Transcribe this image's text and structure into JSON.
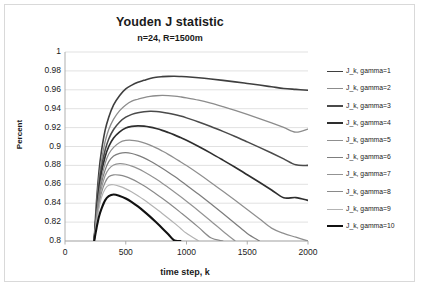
{
  "chart_data": {
    "type": "line",
    "title": "Youden J statistic",
    "subtitle": "n=24, R=1500m",
    "xlabel": "time step, k",
    "ylabel": "Percent",
    "xlim": [
      0,
      2000
    ],
    "ylim": [
      0.8,
      1.0
    ],
    "xticks": [
      "0",
      "500",
      "1000",
      "1500",
      "2000"
    ],
    "yticks": [
      "1",
      "0.98",
      "0.96",
      "0.94",
      "0.92",
      "0.9",
      "0.88",
      "0.86",
      "0.84",
      "0.82",
      "0.8"
    ],
    "grid": "horizontal",
    "legend_position": "right",
    "x": [
      240,
      260,
      280,
      300,
      330,
      360,
      400,
      450,
      500,
      550,
      600,
      650,
      700,
      750,
      800,
      850,
      900,
      950,
      1000,
      1100,
      1200,
      1300,
      1400,
      1500,
      1600,
      1700,
      1800,
      1900,
      2000
    ],
    "series": [
      {
        "name": "J_k, gamma=1",
        "color": "#3f3f3f",
        "width": 1.6,
        "values": [
          0.8,
          0.843,
          0.874,
          0.895,
          0.917,
          0.931,
          0.944,
          0.954,
          0.961,
          0.965,
          0.968,
          0.97,
          0.972,
          0.9733,
          0.9739,
          0.9742,
          0.9743,
          0.9741,
          0.9738,
          0.9728,
          0.9715,
          0.97,
          0.9684,
          0.9667,
          0.965,
          0.9632,
          0.9614,
          0.9604,
          0.9595
        ]
      },
      {
        "name": "J_k, gamma=2",
        "color": "#8c8c8c",
        "width": 1.3,
        "values": [
          0.8,
          0.838,
          0.866,
          0.885,
          0.905,
          0.918,
          0.929,
          0.938,
          0.944,
          0.948,
          0.95,
          0.9518,
          0.953,
          0.9537,
          0.954,
          0.9538,
          0.9533,
          0.9525,
          0.9515,
          0.949,
          0.9458,
          0.9421,
          0.9382,
          0.934,
          0.9296,
          0.925,
          0.9202,
          0.9152,
          0.9185
        ]
      },
      {
        "name": "J_k, gamma=3",
        "color": "#4a4a4a",
        "width": 1.55,
        "values": [
          0.8,
          0.834,
          0.86,
          0.878,
          0.896,
          0.908,
          0.918,
          0.926,
          0.931,
          0.934,
          0.9358,
          0.9368,
          0.9372,
          0.937,
          0.9363,
          0.9352,
          0.9338,
          0.9322,
          0.9303,
          0.926,
          0.9212,
          0.916,
          0.9106,
          0.9049,
          0.8991,
          0.8931,
          0.8869,
          0.8806,
          0.88
        ]
      },
      {
        "name": "J_k, gamma=4",
        "color": "#2e2e2e",
        "width": 1.7,
        "values": [
          0.8,
          0.831,
          0.855,
          0.872,
          0.889,
          0.9,
          0.909,
          0.9155,
          0.9196,
          0.9213,
          0.9218,
          0.9215,
          0.9205,
          0.919,
          0.9171,
          0.9148,
          0.9123,
          0.9095,
          0.9066,
          0.9,
          0.893,
          0.8856,
          0.878,
          0.8701,
          0.8621,
          0.854,
          0.8457,
          0.846,
          0.843
        ]
      },
      {
        "name": "J_k, gamma=5",
        "color": "#8f8f8f",
        "width": 1.25,
        "values": [
          0.8,
          0.828,
          0.85,
          0.866,
          0.882,
          0.892,
          0.899,
          0.9043,
          0.9064,
          0.9066,
          0.9056,
          0.9038,
          0.9014,
          0.8985,
          0.8952,
          0.8917,
          0.8879,
          0.8839,
          0.8798,
          0.8711,
          0.862,
          0.8526,
          0.843,
          0.8333,
          0.8235,
          0.8136,
          0.808,
          0.804,
          0.8
        ]
      },
      {
        "name": "J_k, gamma=6",
        "color": "#7d7d7d",
        "width": 1.25,
        "values": [
          0.8,
          0.826,
          0.846,
          0.861,
          0.875,
          0.884,
          0.89,
          0.8928,
          0.8935,
          0.8926,
          0.8906,
          0.8879,
          0.8847,
          0.881,
          0.877,
          0.8728,
          0.8684,
          0.8638,
          0.8591,
          0.8494,
          0.8393,
          0.829,
          0.8186,
          0.808,
          0.8,
          0.8,
          0.8,
          0.8,
          0.8
        ]
      },
      {
        "name": "J_k, gamma=7",
        "color": "#939393",
        "width": 1.2,
        "values": [
          0.8,
          0.824,
          0.842,
          0.856,
          0.869,
          0.876,
          0.8805,
          0.8818,
          0.8812,
          0.8793,
          0.8766,
          0.8733,
          0.8696,
          0.8655,
          0.8612,
          0.8566,
          0.8519,
          0.8471,
          0.8421,
          0.8318,
          0.8212,
          0.8104,
          0.8,
          0.8,
          0.8,
          0.8,
          0.8,
          0.8,
          0.8
        ]
      },
      {
        "name": "J_k, gamma=8",
        "color": "#8a8a8a",
        "width": 1.2,
        "values": [
          0.8,
          0.822,
          0.838,
          0.851,
          0.862,
          0.868,
          0.87,
          0.8697,
          0.8681,
          0.8655,
          0.8622,
          0.8584,
          0.8543,
          0.8498,
          0.8452,
          0.8404,
          0.8354,
          0.8303,
          0.8251,
          0.8144,
          0.8034,
          0.8,
          0.8,
          0.8,
          0.8,
          0.8,
          0.8,
          0.8,
          0.8
        ]
      },
      {
        "name": "J_k, gamma=9",
        "color": "#b3b3b3",
        "width": 1.2,
        "values": [
          0.8,
          0.82,
          0.835,
          0.846,
          0.855,
          0.859,
          0.8595,
          0.8578,
          0.8552,
          0.8518,
          0.8479,
          0.8436,
          0.839,
          0.8342,
          0.8292,
          0.8241,
          0.8189,
          0.8135,
          0.8081,
          0.8,
          0.8,
          0.8,
          0.8,
          0.8,
          0.8,
          0.8,
          0.8,
          0.8,
          0.8
        ]
      },
      {
        "name": "J_k, gamma=10",
        "color": "#111111",
        "width": 2.1,
        "values": [
          0.8,
          0.814,
          0.826,
          0.834,
          0.843,
          0.8474,
          0.8492,
          0.8477,
          0.845,
          0.8412,
          0.8366,
          0.8314,
          0.8258,
          0.8198,
          0.8136,
          0.8071,
          0.8005,
          0.8,
          0.8,
          0.8,
          0.8,
          0.8,
          0.8,
          0.8,
          0.8,
          0.8,
          0.8,
          0.8,
          0.8
        ]
      }
    ]
  },
  "legend": {
    "items": [
      {
        "label": "J_k, gamma=1"
      },
      {
        "label": "J_k, gamma=2"
      },
      {
        "label": "J_k, gamma=3"
      },
      {
        "label": "J_k, gamma=4"
      },
      {
        "label": "J_k, gamma=5"
      },
      {
        "label": "J_k, gamma=6"
      },
      {
        "label": "J_k, gamma=7"
      },
      {
        "label": "J_k, gamma=8"
      },
      {
        "label": "J_k, gamma=9"
      },
      {
        "label": "J_k, gamma=10"
      }
    ]
  },
  "colors": {
    "grid": "#d9d9d9",
    "axis": "#a6a6a6",
    "frame": "#d9d9d9",
    "text": "#1a1a1a",
    "background": "#ffffff"
  }
}
